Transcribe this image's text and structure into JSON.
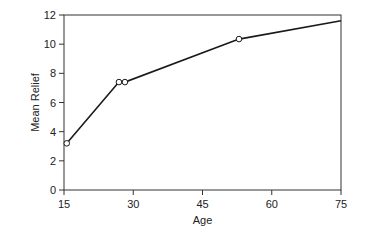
{
  "chart_data": {
    "type": "line",
    "title": "",
    "xlabel": "Age",
    "ylabel": "Mean Relief",
    "xlim": [
      15,
      75
    ],
    "ylim": [
      0,
      12
    ],
    "xticks": [
      15,
      30,
      45,
      60,
      75
    ],
    "yticks": [
      0,
      2,
      4,
      6,
      8,
      10,
      12
    ],
    "grid": false,
    "legend": null,
    "series": [
      {
        "name": "Mean Relief",
        "x": [
          15.6,
          26.9,
          28.2,
          52.9,
          75
        ],
        "y": [
          3.2,
          7.4,
          7.4,
          10.35,
          11.6
        ],
        "markers": [
          true,
          true,
          true,
          true,
          false
        ]
      }
    ]
  },
  "colors": {
    "line": "#1a1a1a",
    "axis": "#333333",
    "marker_fill": "#ffffff"
  }
}
